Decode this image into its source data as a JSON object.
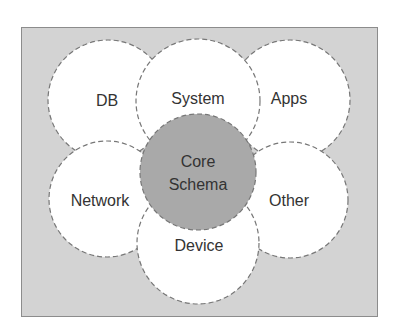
{
  "diagram": {
    "type": "schema-overlap",
    "colors": {
      "frame_background": "#d3d3d3",
      "frame_border": "#8c8c8c",
      "outer_circle_fill": "#ffffff",
      "core_circle_fill": "#a9a9a9",
      "dashed_stroke": "#777777",
      "text": "#333333"
    },
    "core": {
      "line1": "Core",
      "line2": "Schema"
    },
    "nodes": [
      {
        "id": "db",
        "label": "DB"
      },
      {
        "id": "system",
        "label": "System"
      },
      {
        "id": "apps",
        "label": "Apps"
      },
      {
        "id": "network",
        "label": "Network"
      },
      {
        "id": "other",
        "label": "Other"
      },
      {
        "id": "device",
        "label": "Device"
      }
    ]
  }
}
